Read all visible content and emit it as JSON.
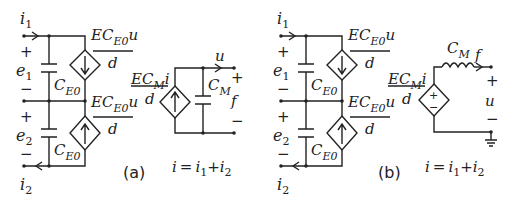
{
  "figure": {
    "panels": [
      {
        "id": "a",
        "label": "(a)",
        "equation": {
          "lhs": "i",
          "eq": "=",
          "t1": "i",
          "t1sub": "1",
          "plus": "+",
          "t2": "i",
          "t2sub": "2"
        },
        "currents": {
          "i1": {
            "main": "i",
            "sub": "1"
          },
          "i2": {
            "main": "i",
            "sub": "2"
          }
        },
        "sources": {
          "e1": {
            "main": "e",
            "sub": "1",
            "plus": "+",
            "minus": "−"
          },
          "e2": {
            "main": "e",
            "sub": "2",
            "plus": "+",
            "minus": "−"
          }
        },
        "capacitors": {
          "ce0_top": {
            "main": "C",
            "sub": "E0"
          },
          "ce0_bottom": {
            "main": "C",
            "sub": "E0"
          },
          "cm": {
            "main": "C",
            "sub": "M"
          }
        },
        "controlled_sources": {
          "top": {
            "num_a": "EC",
            "num_sub": "E0",
            "num_b": "u",
            "den": "d",
            "direction": "down"
          },
          "bottom": {
            "num_a": "EC",
            "num_sub": "E0",
            "num_b": "u",
            "den": "d",
            "direction": "up"
          },
          "right": {
            "num_a": "EC",
            "num_sub": "M",
            "num_b": "i",
            "den": "d",
            "direction": "up"
          }
        },
        "output": {
          "arrow_label": "u",
          "port_label": "f",
          "plus": "+",
          "minus": "−"
        }
      },
      {
        "id": "b",
        "label": "(b)",
        "equation": {
          "lhs": "i",
          "eq": "=",
          "t1": "i",
          "t1sub": "1",
          "plus": "+",
          "t2": "i",
          "t2sub": "2"
        },
        "currents": {
          "i1": {
            "main": "i",
            "sub": "1"
          },
          "i2": {
            "main": "i",
            "sub": "2"
          }
        },
        "sources": {
          "e1": {
            "main": "e",
            "sub": "1",
            "plus": "+",
            "minus": "−"
          },
          "e2": {
            "main": "e",
            "sub": "2",
            "plus": "+",
            "minus": "−"
          }
        },
        "capacitors": {
          "ce0_top": {
            "main": "C",
            "sub": "E0"
          },
          "ce0_bottom": {
            "main": "C",
            "sub": "E0"
          }
        },
        "inductor": {
          "main": "C",
          "sub": "M"
        },
        "controlled_sources": {
          "top": {
            "num_a": "EC",
            "num_sub": "E0",
            "num_b": "u",
            "den": "d",
            "direction": "down"
          },
          "bottom": {
            "num_a": "EC",
            "num_sub": "E0",
            "num_b": "u",
            "den": "d",
            "direction": "up"
          },
          "right": {
            "num_a": "EC",
            "num_sub": "M",
            "num_b": "i",
            "den": "d",
            "type": "voltage",
            "sign_top": "+",
            "sign_bottom": "−"
          }
        },
        "output": {
          "arrow_label": "f",
          "port_label": "u",
          "plus": "+",
          "minus": "−"
        }
      }
    ]
  }
}
